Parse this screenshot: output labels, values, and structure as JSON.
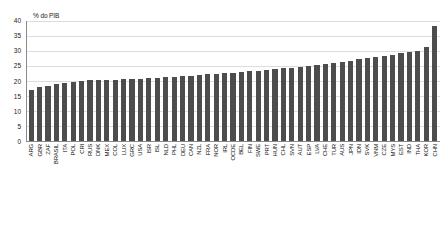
{
  "chart_data": {
    "type": "bar",
    "title": "",
    "subtitle": "",
    "xlabel": "",
    "ylabel": "% do PIB",
    "ylim": [
      0,
      40
    ],
    "ytick_step": 5,
    "yticks": [
      "0",
      "5",
      "10",
      "15",
      "20",
      "25",
      "30",
      "35",
      "40"
    ],
    "grid": true,
    "legend": false,
    "legend_position": "none",
    "bar_color": "#4d4d4d",
    "axis_color": "#8a8a8a",
    "grid_color": "#dcdcdc",
    "sorted": "ascending",
    "categories": [
      "ARG",
      "GBR",
      "ZAF",
      "BRASIL",
      "ITA",
      "POL",
      "CRI",
      "RUS",
      "DNK",
      "MEX",
      "COL",
      "LUX",
      "GRC",
      "USA",
      "ISR",
      "ISL",
      "NLD",
      "PHL",
      "DEU",
      "CAN",
      "NZL",
      "FRA",
      "NOR",
      "IRL",
      "OCDE",
      "BEL",
      "FIN",
      "SWE",
      "PRT",
      "HUN",
      "CHL",
      "SVN",
      "AUT",
      "ESP",
      "LVA",
      "CHE",
      "TUR",
      "AUS",
      "JPN",
      "IDN",
      "SVK",
      "VNM",
      "CZE",
      "MYS",
      "EST",
      "IND",
      "THA",
      "KOR",
      "CHN"
    ],
    "values": [
      17.0,
      17.9,
      18.5,
      19.0,
      19.4,
      19.8,
      20.0,
      20.2,
      20.3,
      20.4,
      20.5,
      20.6,
      20.7,
      20.8,
      20.9,
      21.0,
      21.2,
      21.4,
      21.6,
      21.8,
      22.0,
      22.2,
      22.4,
      22.6,
      22.8,
      23.0,
      23.2,
      23.4,
      23.6,
      23.9,
      24.2,
      24.5,
      24.8,
      25.0,
      25.3,
      25.6,
      26.0,
      26.4,
      26.8,
      27.2,
      27.6,
      28.0,
      28.4,
      28.8,
      29.2,
      29.6,
      30.0,
      31.5,
      38.5
    ],
    "units": "percent of GDP"
  }
}
